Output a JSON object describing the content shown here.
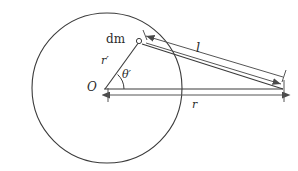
{
  "figure": {
    "background_color": "#ffffff",
    "stroke_color": "#3a3a3a",
    "line_color": "#555555",
    "text_color": "#2b2b2b",
    "width": 298,
    "height": 171
  },
  "labels": {
    "mass_element": "dm",
    "distance_l": "l",
    "radius_inner": "r′",
    "angle": "θ′",
    "origin": "O",
    "radius_r": "r"
  },
  "geometry": {
    "circle": {
      "cx": 107,
      "cy": 88,
      "r": 75
    },
    "origin_point": {
      "x": 104,
      "y": 90
    },
    "dm_point": {
      "x": 139,
      "y": 41
    },
    "field_point": {
      "x": 283,
      "y": 90
    },
    "l_arrow_top": {
      "x1": 283,
      "y1": 78,
      "x2": 144,
      "y2": 38
    },
    "l_arrow_bottom": {
      "x1": 146,
      "y1": 45,
      "x2": 281,
      "y2": 85
    },
    "r_arrow": {
      "x1": 283,
      "y1": 95,
      "x2": 110,
      "y2": 95
    },
    "angle_arc_radius": 18
  },
  "elements": {
    "circle_name": "sphere-outline",
    "radius_line_name": "radius-r-prime-line",
    "baseline_name": "baseline-horizontal",
    "l_measure_name": "distance-l-measure",
    "r_measure_name": "distance-r-measure",
    "angle_arc_name": "angle-theta-prime-arc",
    "dm_marker_name": "dm-point-marker"
  }
}
